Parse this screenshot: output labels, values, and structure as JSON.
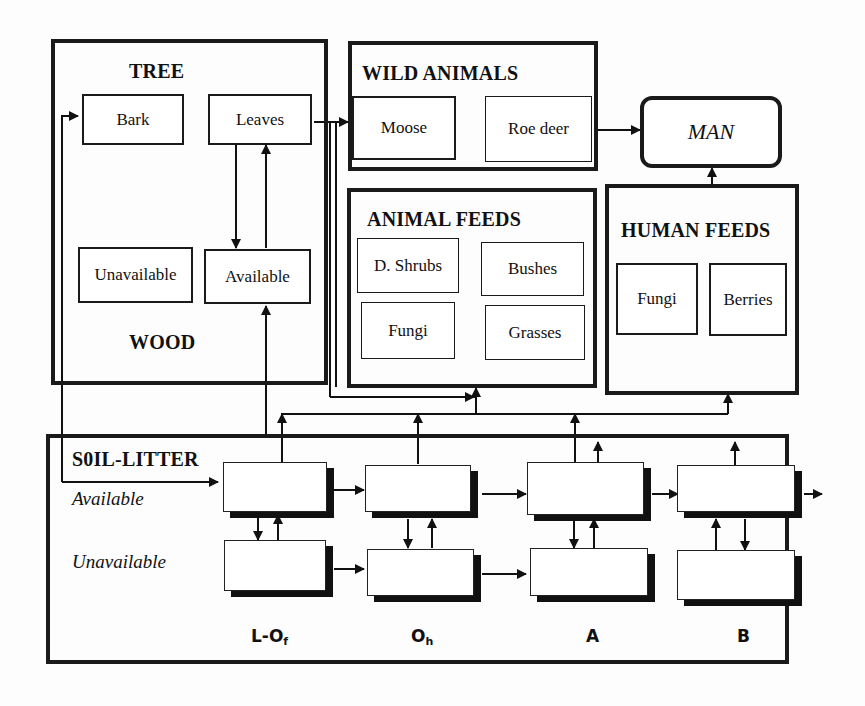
{
  "diagram": {
    "type": "flow",
    "groups": {
      "tree": {
        "title": "TREE",
        "subtitle": "WOOD",
        "items": {
          "bark": "Bark",
          "leaves": "Leaves",
          "unavailable": "Unavailable",
          "available": "Available"
        }
      },
      "wild_animals": {
        "title": "WILD ANIMALS",
        "items": {
          "moose": "Moose",
          "roe_deer": "Roe deer"
        }
      },
      "man": {
        "label": "MAN"
      },
      "animal_feeds": {
        "title": "ANIMAL FEEDS",
        "items": {
          "d_shrubs": "D. Shrubs",
          "bushes": "Bushes",
          "fungi": "Fungi",
          "grasses": "Grasses"
        }
      },
      "human_feeds": {
        "title": "HUMAN FEEDS",
        "items": {
          "fungi": "Fungi",
          "berries": "Berries"
        }
      },
      "soil_litter": {
        "title": "S0IL-LITTER",
        "rows": {
          "available": "Available",
          "unavailable": "Unavailable"
        },
        "horizons": [
          {
            "main": "L-O",
            "sub": "f"
          },
          {
            "main": "O",
            "sub": "h"
          },
          {
            "main": "A",
            "sub": ""
          },
          {
            "main": "B",
            "sub": ""
          }
        ]
      }
    },
    "edges": [
      {
        "from": "Leaves",
        "to": "Available (Wood)"
      },
      {
        "from": "Available (Wood)",
        "to": "Leaves"
      },
      {
        "from": "Leaves",
        "to": "WILD ANIMALS"
      },
      {
        "from": "Leaves",
        "to": "ANIMAL FEEDS"
      },
      {
        "from": "Roe deer",
        "to": "MAN"
      },
      {
        "from": "HUMAN FEEDS",
        "to": "MAN"
      },
      {
        "from": "Soil L-Of Available",
        "to": "Bark"
      },
      {
        "from": "Bark",
        "to": "Soil L-Of Available"
      },
      {
        "from": "Soil L-Of Available",
        "to": "Available (Wood)"
      },
      {
        "from": "Soil horizons",
        "to": "ANIMAL FEEDS"
      },
      {
        "from": "Soil horizons",
        "to": "HUMAN FEEDS"
      },
      {
        "from": "L-Of Available",
        "to": "Oh Available"
      },
      {
        "from": "Oh Available",
        "to": "A Available"
      },
      {
        "from": "A Available",
        "to": "B Available"
      },
      {
        "from": "B Available",
        "to": "out"
      },
      {
        "from": "L-Of Unavailable",
        "to": "Oh Unavailable"
      },
      {
        "from": "Oh Unavailable",
        "to": "A Unavailable"
      },
      {
        "from": "Available",
        "to": "Unavailable",
        "bidirectional": true
      }
    ]
  }
}
